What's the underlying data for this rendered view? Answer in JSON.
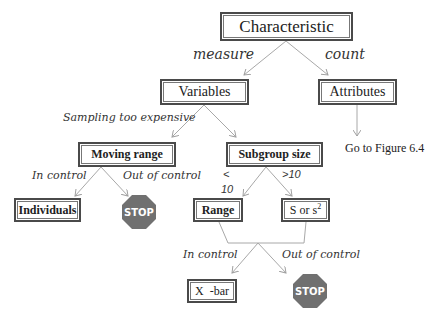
{
  "diagram": {
    "nodes": {
      "characteristic": "Characteristic",
      "variables": "Variables",
      "attributes": "Attributes",
      "moving_range": "Moving range",
      "subgroup_size": "Subgroup size",
      "individuals": "Individuals",
      "range": "Range",
      "s_or_s2": "S or s",
      "s_or_s2_sup": "2",
      "xbar": "X  -bar",
      "stop_label": "STOP"
    },
    "edge_labels": {
      "measure": "measure",
      "count": "count",
      "sampling_too_expensive": "Sampling too expensive",
      "mr_in_control": "In control",
      "mr_out_of_control": "Out of control",
      "lt": "<",
      "lt_10": "10",
      "gt_10": ">10",
      "in_control": "In control",
      "out_of_control": "Out of control"
    },
    "note": "Go to Figure 6.4",
    "colors": {
      "line": "#a8a8a8",
      "box_border": "#4a4a4a",
      "stop_fill": "#707070"
    }
  }
}
